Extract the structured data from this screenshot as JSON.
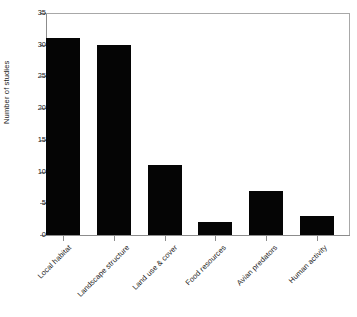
{
  "chart_data": {
    "type": "bar",
    "title": "",
    "subtitle": "",
    "xlabel": "",
    "ylabel": "Number of studies",
    "categories": [
      "Local habitat",
      "Landscape structure",
      "Land use & cover",
      "Food resources",
      "Avian predators",
      "Human activity"
    ],
    "values": [
      31,
      30,
      11,
      2,
      7,
      3
    ],
    "ylim": [
      0,
      35
    ],
    "yticks": [
      0,
      5,
      10,
      15,
      20,
      25,
      30,
      35
    ],
    "ytick_labels": [
      "0",
      "5",
      "10",
      "15",
      "20",
      "25",
      "30",
      "35"
    ],
    "grid": false,
    "legend": null,
    "bar_color": "#050505",
    "axis_color": "#8c8c8c",
    "frame_color": "#a8a8a8",
    "text_color": "#1a1a1a",
    "background": "#ffffff",
    "xtick_label_rotation": -45
  }
}
